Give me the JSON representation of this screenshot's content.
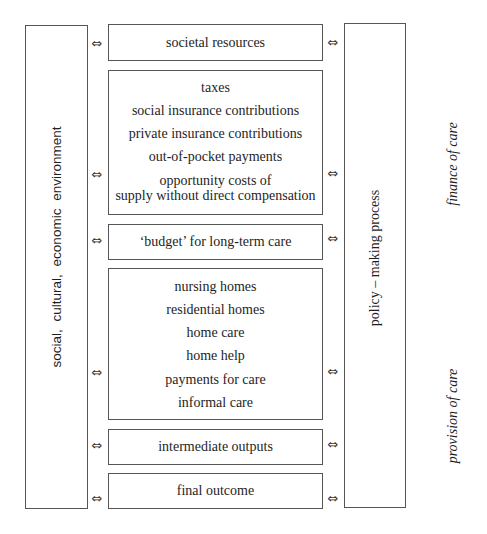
{
  "diagram": {
    "left_panel": {
      "label": "social,  cultural,  economic  environment"
    },
    "right_panel": {
      "label": "policy – making process"
    },
    "side_labels": {
      "finance": "finance of care",
      "provision": "provision of care"
    },
    "arrow_glyph": "⇔",
    "boxes": {
      "societal_resources": {
        "lines": [
          "societal resources"
        ]
      },
      "finance_sources": {
        "lines": [
          "taxes",
          "social insurance contributions",
          "private insurance contributions",
          "out-of-pocket payments",
          "opportunity costs of",
          "supply without direct compensation"
        ]
      },
      "budget": {
        "lines": [
          "‘budget’ for long-term care"
        ]
      },
      "provision": {
        "lines": [
          "nursing homes",
          "residential homes",
          "home care",
          "home help",
          "payments for care",
          "informal care"
        ]
      },
      "intermediate_outputs": {
        "lines": [
          "intermediate outputs"
        ]
      },
      "final_outcome": {
        "lines": [
          "final outcome"
        ]
      }
    }
  }
}
